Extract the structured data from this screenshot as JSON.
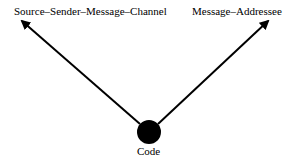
{
  "diagram": {
    "nodes": {
      "left": {
        "label": "Source–Sender–Message–Channel"
      },
      "right": {
        "label": "Message–Addressee"
      },
      "center": {
        "label": "Code"
      }
    },
    "edges": [
      {
        "from": "Code",
        "to": "Source–Sender–Message–Channel",
        "style": "arrow"
      },
      {
        "from": "Code",
        "to": "Message–Addressee",
        "style": "arrow"
      }
    ],
    "colors": {
      "line": "#000000",
      "node": "#000000",
      "background": "#ffffff"
    }
  }
}
